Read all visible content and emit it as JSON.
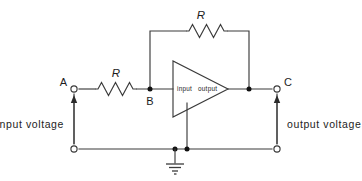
{
  "diagram": {
    "nodes": {
      "a_label": "A",
      "b_label": "B",
      "c_label": "C"
    },
    "components": {
      "input_resistor_label": "R",
      "feedback_resistor_label": "R",
      "opamp_input_label": "input",
      "opamp_output_label": "output"
    },
    "annotations": {
      "input_voltage_label": "input voltage",
      "output_voltage_label": "output voltage"
    },
    "icons": {
      "ground": "ground-symbol",
      "opamp": "opamp-triangle-icon",
      "resistor": "resistor-zigzag-icon",
      "terminal": "open-terminal-icon",
      "junction": "junction-dot-icon",
      "arrow_up": "up-arrow-icon"
    },
    "colors": {
      "wire": "#3b3b3b",
      "text": "#1d1d1d",
      "background": "#ffffff",
      "junction": "#111111"
    }
  }
}
